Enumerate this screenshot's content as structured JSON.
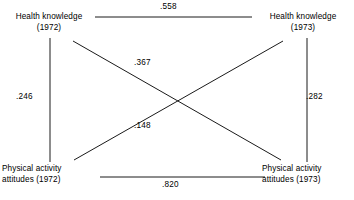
{
  "diagram": {
    "type": "cross-lagged-panel-correlation",
    "nodes": [
      {
        "id": "health-knowledge-1972",
        "line1": "Health knowledge",
        "line2": "(1972)",
        "position": "top-left"
      },
      {
        "id": "health-knowledge-1973",
        "line1": "Health knowledge",
        "line2": "(1973)",
        "position": "top-right"
      },
      {
        "id": "physical-activity-attitudes-1972",
        "line1": "Physical activity",
        "line2": "attitudes (1972)",
        "position": "bottom-left"
      },
      {
        "id": "physical-activity-attitudes-1973",
        "line1": "Physical activity",
        "line2": "attitudes (1973)",
        "position": "bottom-right"
      }
    ],
    "edges": [
      {
        "id": "top-horizontal",
        "value": ".558",
        "from": "health-knowledge-1972",
        "to": "health-knowledge-1973"
      },
      {
        "id": "bottom-horizontal",
        "value": ".820",
        "from": "physical-activity-attitudes-1972",
        "to": "physical-activity-attitudes-1973"
      },
      {
        "id": "left-vertical",
        "value": ".246",
        "from": "health-knowledge-1972",
        "to": "physical-activity-attitudes-1972"
      },
      {
        "id": "right-vertical",
        "value": ".282",
        "from": "health-knowledge-1973",
        "to": "physical-activity-attitudes-1973"
      },
      {
        "id": "diagonal-descending",
        "value": ".367",
        "from": "health-knowledge-1972",
        "to": "physical-activity-attitudes-1973"
      },
      {
        "id": "diagonal-ascending",
        "value": ".148",
        "from": "physical-activity-attitudes-1972",
        "to": "health-knowledge-1973"
      }
    ],
    "colors": {
      "line": "#1a1a1a",
      "text": "#000000",
      "background": "#ffffff"
    }
  }
}
